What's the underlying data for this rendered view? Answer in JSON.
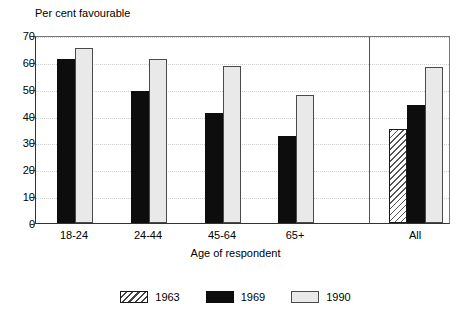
{
  "chart_data": {
    "type": "bar",
    "title": "",
    "ylabel": "Per cent favourable",
    "xlabel": "Age of respondent",
    "categories": [
      "18-24",
      "24-44",
      "45-64",
      "65+",
      "All"
    ],
    "series": [
      {
        "name": "1963",
        "values": [
          null,
          null,
          null,
          null,
          35
        ]
      },
      {
        "name": "1969",
        "values": [
          61,
          49,
          41,
          32.5,
          44
        ]
      },
      {
        "name": "1990",
        "values": [
          65,
          61,
          58.5,
          47.5,
          58
        ]
      }
    ],
    "ylim": [
      0,
      70
    ],
    "yticks": [
      0,
      10,
      20,
      30,
      40,
      50,
      60,
      70
    ],
    "ytick_labels": [
      "0",
      "10",
      "20",
      "30",
      "40",
      "50",
      "60",
      "70"
    ],
    "grid": true,
    "grid_axis": "y",
    "legend_position": "bottom",
    "colors": {
      "1963": "#ffffff",
      "1969": "#0d0d0d",
      "1990": "#e9e9e9",
      "axis": "#333333",
      "grid": "#cfcfcf"
    }
  },
  "legend": {
    "items": [
      {
        "label": "1963",
        "pattern": "hatched"
      },
      {
        "label": "1969",
        "pattern": "solid-black"
      },
      {
        "label": "1990",
        "pattern": "light-gray"
      }
    ]
  }
}
